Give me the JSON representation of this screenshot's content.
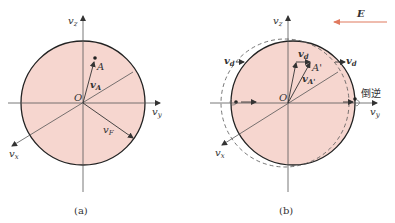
{
  "figure": {
    "colors": {
      "sphere_fill": "#f6d6cf",
      "sphere_stroke": "#222222",
      "axis": "#555555",
      "field_arrow": "#e07a5f",
      "dashed": "#555555"
    },
    "panel_a": {
      "caption": "(a)",
      "axes": {
        "vz": "v",
        "vz_sub": "z",
        "vy": "v",
        "vy_sub": "y",
        "vx": "v",
        "vx_sub": "x"
      },
      "origin_label": "O",
      "point_label": "A",
      "vector_A": "v",
      "vector_A_sub": "A",
      "vector_F": "v",
      "vector_F_sub": "F"
    },
    "panel_b": {
      "caption": "(b)",
      "axes": {
        "vz": "v",
        "vz_sub": "z",
        "vy": "v",
        "vy_sub": "y",
        "vx": "v",
        "vx_sub": "x"
      },
      "origin_label": "O",
      "point_label": "A'",
      "vector_d": "v",
      "vector_d_sub": "d",
      "vector_Aprime": "v",
      "vector_Aprime_sub": "A'",
      "field_label": "E",
      "reverse_label": "倒逆"
    }
  }
}
